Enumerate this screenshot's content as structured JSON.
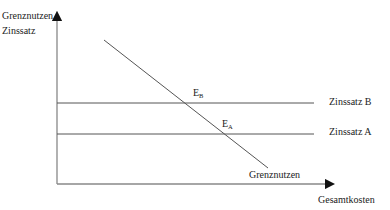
{
  "diagram": {
    "y_axis_label_line1": "Grenznutzen",
    "y_axis_label_line2": "Zinssatz",
    "x_axis_label": "Gesamtkosten",
    "curve_label": "Grenznutzen",
    "rate_b_label": "Zinssatz B",
    "rate_a_label": "Zinssatz A",
    "point_b": {
      "base": "E",
      "sub": "B"
    },
    "point_a": {
      "base": "E",
      "sub": "A"
    },
    "colors": {
      "line": "#555555",
      "axis": "#777777",
      "text": "#222222"
    }
  }
}
